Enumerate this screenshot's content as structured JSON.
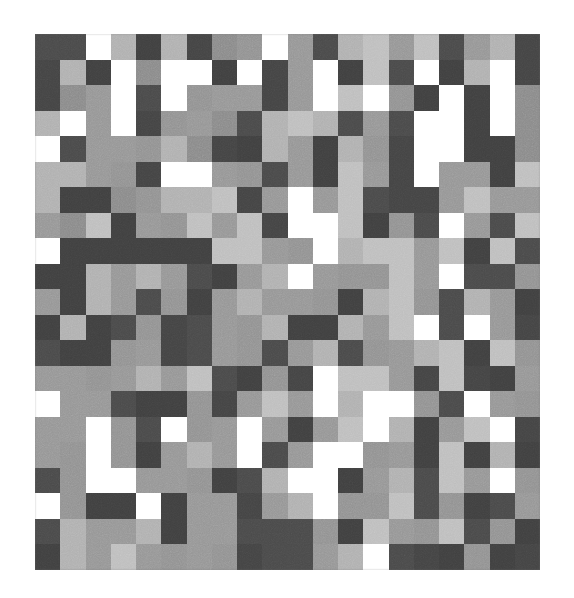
{
  "figure": {
    "type": "heatmap",
    "background_color": "#ffffff",
    "plot_left": 35,
    "plot_top": 34,
    "plot_width": 505,
    "plot_height": 536,
    "cell_width": 25.25,
    "cell_height": 25.52,
    "texture": "grainy-noise",
    "title": "",
    "xlabel": "",
    "ylabel": "",
    "axes_visible": false,
    "ticks_visible": false,
    "colorbar_visible": false,
    "legend_visible": false
  },
  "chart_data": {
    "type": "heatmap",
    "title": "",
    "subtitle": "",
    "xlabel": "",
    "ylabel": "",
    "xticklabels": [],
    "yticklabels": [],
    "legend": [],
    "annotations": [],
    "grid": false,
    "colormap": "gray",
    "vmin": 0,
    "vmax": 255,
    "n_rows": 21,
    "n_cols": 20,
    "palette": {
      "near_black": "#3d3d3d",
      "dark": "#4a4a4a",
      "mid_dark": "#6a6a6a",
      "mid": "#8a8a8a",
      "mid_light": "#a5a5a5",
      "light": "#bfbfbf",
      "white": "#ffffff"
    },
    "values": [
      [
        74,
        74,
        255,
        176,
        64,
        176,
        68,
        138,
        146,
        255,
        150,
        74,
        176,
        190,
        150,
        190,
        74,
        150,
        176,
        68
      ],
      [
        68,
        176,
        64,
        255,
        138,
        255,
        255,
        64,
        255,
        68,
        150,
        255,
        64,
        190,
        74,
        255,
        64,
        176,
        255,
        68
      ],
      [
        68,
        138,
        150,
        255,
        74,
        255,
        146,
        150,
        150,
        68,
        150,
        255,
        190,
        255,
        146,
        64,
        255,
        64,
        255,
        138
      ],
      [
        176,
        255,
        150,
        255,
        68,
        146,
        150,
        138,
        74,
        176,
        190,
        176,
        74,
        150,
        74,
        255,
        255,
        64,
        255,
        138
      ],
      [
        255,
        74,
        150,
        150,
        146,
        176,
        138,
        68,
        64,
        176,
        150,
        64,
        176,
        146,
        68,
        255,
        255,
        64,
        64,
        138
      ],
      [
        176,
        176,
        150,
        146,
        68,
        255,
        255,
        150,
        146,
        74,
        150,
        64,
        190,
        150,
        68,
        255,
        150,
        150,
        64,
        190
      ],
      [
        176,
        64,
        64,
        138,
        146,
        176,
        176,
        190,
        68,
        150,
        255,
        150,
        190,
        74,
        68,
        68,
        150,
        190,
        150,
        150
      ],
      [
        150,
        138,
        190,
        64,
        150,
        146,
        190,
        150,
        190,
        68,
        255,
        255,
        190,
        64,
        146,
        74,
        255,
        150,
        74,
        190
      ],
      [
        255,
        64,
        64,
        64,
        64,
        64,
        64,
        190,
        190,
        150,
        146,
        255,
        176,
        190,
        190,
        150,
        190,
        64,
        190,
        74
      ],
      [
        64,
        64,
        176,
        150,
        176,
        150,
        74,
        64,
        150,
        176,
        255,
        150,
        146,
        146,
        190,
        150,
        255,
        74,
        74,
        146
      ],
      [
        150,
        64,
        176,
        150,
        74,
        146,
        64,
        150,
        176,
        150,
        150,
        146,
        64,
        176,
        190,
        146,
        74,
        176,
        150,
        64
      ],
      [
        64,
        176,
        64,
        74,
        146,
        68,
        74,
        150,
        146,
        176,
        64,
        64,
        176,
        150,
        190,
        255,
        74,
        255,
        150,
        68
      ],
      [
        74,
        64,
        64,
        146,
        150,
        68,
        74,
        150,
        146,
        74,
        150,
        176,
        74,
        146,
        150,
        176,
        190,
        64,
        190,
        146
      ],
      [
        150,
        150,
        146,
        150,
        176,
        150,
        190,
        74,
        64,
        146,
        68,
        255,
        190,
        190,
        150,
        68,
        190,
        68,
        64,
        150
      ],
      [
        255,
        150,
        150,
        74,
        64,
        64,
        146,
        68,
        150,
        190,
        150,
        255,
        176,
        255,
        255,
        146,
        74,
        255,
        150,
        146
      ],
      [
        150,
        150,
        255,
        146,
        74,
        255,
        146,
        150,
        255,
        150,
        64,
        150,
        190,
        255,
        176,
        64,
        150,
        190,
        255,
        68
      ],
      [
        150,
        146,
        255,
        146,
        64,
        150,
        176,
        150,
        255,
        74,
        150,
        255,
        255,
        146,
        150,
        64,
        190,
        64,
        176,
        64
      ],
      [
        74,
        146,
        255,
        255,
        150,
        150,
        146,
        64,
        74,
        176,
        255,
        255,
        64,
        150,
        176,
        74,
        190,
        150,
        255,
        146
      ],
      [
        255,
        146,
        64,
        64,
        255,
        64,
        150,
        150,
        68,
        150,
        176,
        255,
        146,
        146,
        190,
        74,
        146,
        64,
        74,
        150
      ],
      [
        74,
        176,
        150,
        150,
        176,
        64,
        150,
        150,
        74,
        74,
        74,
        146,
        64,
        190,
        150,
        146,
        190,
        74,
        146,
        64
      ],
      [
        64,
        176,
        150,
        190,
        150,
        146,
        150,
        146,
        68,
        74,
        74,
        150,
        176,
        255,
        74,
        68,
        64,
        146,
        64,
        68
      ]
    ]
  }
}
